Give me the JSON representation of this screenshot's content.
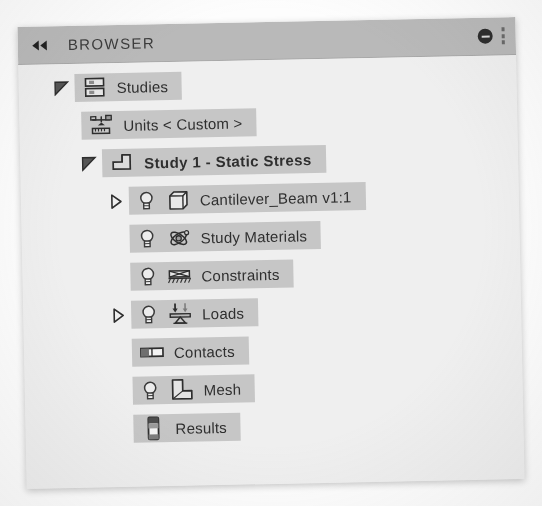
{
  "header": {
    "title": "BROWSER",
    "collapse_icon": "double-chevron-left-icon",
    "minimize_icon": "minus-circle-icon",
    "grip_icon": "resize-grip-icon"
  },
  "colors": {
    "header_bg": "#b9b9b9",
    "panel_bg": "#efefef",
    "row_highlight": "#c6c6c6",
    "text": "#2f2f2f"
  },
  "tree": {
    "nodes": [
      {
        "label": "Studies",
        "icon": "studies-stack-icon",
        "twisty": "expanded",
        "bulb": false,
        "bold": false,
        "indent": "lvl-0"
      },
      {
        "label": "Units < Custom >",
        "icon": "units-scale-icon",
        "twisty": "none",
        "bulb": false,
        "bold": false,
        "indent": "lvl-1"
      },
      {
        "label": "Study 1 - Static Stress",
        "icon": "static-stress-icon",
        "twisty": "expanded",
        "bulb": false,
        "bold": true,
        "indent": "lvl-2"
      },
      {
        "label": "Cantilever_Beam v1:1",
        "icon": "cube-component-icon",
        "twisty": "collapsed",
        "bulb": true,
        "bold": false,
        "indent": "lvl-3"
      },
      {
        "label": "Study Materials",
        "icon": "atom-materials-icon",
        "twisty": "none",
        "bulb": true,
        "bold": false,
        "indent": "lvl-3b"
      },
      {
        "label": "Constraints",
        "icon": "constraint-support-icon",
        "twisty": "none",
        "bulb": true,
        "bold": false,
        "indent": "lvl-3b"
      },
      {
        "label": "Loads",
        "icon": "loads-arrow-icon",
        "twisty": "collapsed",
        "bulb": true,
        "bold": false,
        "indent": "lvl-3"
      },
      {
        "label": "Contacts",
        "icon": "contacts-pair-icon",
        "twisty": "none",
        "bulb": false,
        "bold": false,
        "indent": "lvl-3b"
      },
      {
        "label": "Mesh",
        "icon": "mesh-lshape-icon",
        "twisty": "none",
        "bulb": true,
        "bold": false,
        "indent": "lvl-3b"
      },
      {
        "label": "Results",
        "icon": "results-legend-icon",
        "twisty": "none",
        "bulb": false,
        "bold": false,
        "indent": "lvl-3b"
      }
    ]
  }
}
